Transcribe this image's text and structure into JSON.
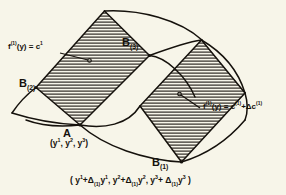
{
  "figure": {
    "name": "curvilinear-coordinate-patch-diagram",
    "background_color": "#f7f5e9",
    "ink_color": "#15110c",
    "hatch_color": "#1a1510",
    "labels": {
      "equation_left": {
        "id": "f1-level-surface-equation",
        "func": "f",
        "func_sup": "(1)",
        "arg": "(y)",
        "relation": " = ",
        "value": "c",
        "value_sup": "1"
      },
      "equation_right": {
        "id": "f2-level-surface-equation",
        "func": "f",
        "func_sup": "(1)",
        "arg": "(y)",
        "relation": " = ",
        "value": "c",
        "value_sup": "(1)",
        "plus": "+Δc",
        "plus_sup": "(1)"
      },
      "vertex_b3": {
        "base": "B",
        "sub": "(3)"
      },
      "vertex_b2": {
        "base": "B",
        "sub": "(2)"
      },
      "vertex_b1": {
        "base": "B",
        "sub": "(1)"
      },
      "vertex_a": {
        "base": "A"
      },
      "vertex_a_coords": {
        "open": "(y",
        "s1": "1",
        "c1": ", y",
        "s2": "2",
        "c2": ", y",
        "s3": "3",
        "close": ")"
      },
      "bottom_formula": {
        "open": "( y",
        "t1_sup": "1",
        "t1_plus": "+Δ",
        "t1_sub": "(1)",
        "t1_var": "y",
        "t1_varsup": "1",
        "sep1": ",  y",
        "t2_sup": "2",
        "t2_plus": "+Δ",
        "t2_sub": "(1)",
        "t2_var": "y",
        "t2_varsup": "2",
        "sep2": ",  y",
        "t3_sup": "3",
        "t3_plus": "+ Δ",
        "t3_sub": "(1)",
        "t3_var": "y",
        "t3_varsup": "3",
        "close": " )"
      }
    },
    "geometry": {
      "description": "Curved quadrilateral mesh patch with two hatched cells",
      "hatch_spacing_px": 3,
      "hatched_cells": 2
    }
  }
}
